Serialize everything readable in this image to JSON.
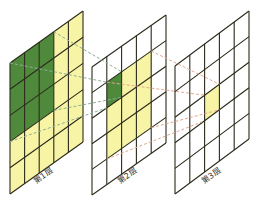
{
  "diagram": {
    "title": "",
    "grid_size": {
      "cols": 5,
      "rows": 5
    },
    "colors": {
      "grid_line": "#2a2a1a",
      "green_fill": "#4f8a3c",
      "yellow_fill": "#f8f4a6",
      "white_fill": "#ffffff",
      "green_dash": "#8fae95",
      "orange_dash": "#e2a890"
    },
    "layers": [
      {
        "id": "layer1",
        "label": "第1层",
        "origin": [
          10,
          63
        ],
        "u": [
          14.6,
          -10.4
        ],
        "v": [
          0,
          26.2
        ],
        "base_fill": "yellow",
        "highlight": {
          "type": "green",
          "cols": [
            0,
            2
          ],
          "rows": [
            0,
            2
          ]
        }
      },
      {
        "id": "layer2",
        "label": "第2层",
        "origin": [
          92,
          67
        ],
        "u": [
          14.8,
          -10.4
        ],
        "v": [
          0,
          25.6
        ],
        "base_fill": "white",
        "yellow_block": {
          "cols": [
            1,
            3
          ],
          "rows": [
            1,
            3
          ]
        },
        "green_cell": {
          "col": 1,
          "row": 1
        }
      },
      {
        "id": "layer3",
        "label": "第3层",
        "origin": [
          175,
          66
        ],
        "u": [
          14.8,
          -11
        ],
        "v": [
          0,
          25.6
        ],
        "base_fill": "white",
        "yellow_cell": {
          "col": 2,
          "row": 2
        }
      }
    ],
    "connections": [
      {
        "from": "layer1 green 3x3 block",
        "to": "layer2 green cell",
        "style": "green-dashed"
      },
      {
        "from": "layer2 yellow 3x3 block",
        "to": "layer3 yellow cell",
        "style": "orange-dashed"
      }
    ]
  }
}
